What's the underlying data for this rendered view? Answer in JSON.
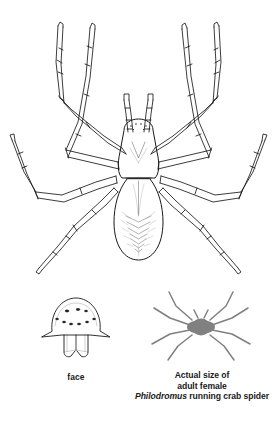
{
  "plate": {
    "background_color": "#ffffff",
    "ink_color": "#1a1a1a",
    "silhouette_color": "#808080"
  },
  "main_figure": {
    "name": "dorsal view line drawing of adult female running crab spider",
    "orientation": "dorsal, head up",
    "leg_pairs": 4,
    "pedipalps": 2
  },
  "face_figure": {
    "name": "frontal view of spider face",
    "eye_count": 8,
    "eye_rows": 2,
    "chelicerae": 2
  },
  "face_label": "face",
  "actual_size_figure": {
    "name": "grey silhouette of spider at actual life size",
    "leg_pairs": 4
  },
  "actual_size_caption": {
    "line1": "Actual size of",
    "line2": "adult female",
    "line3_genus": "Philodromus",
    "line3_rest": " running crab spider"
  }
}
